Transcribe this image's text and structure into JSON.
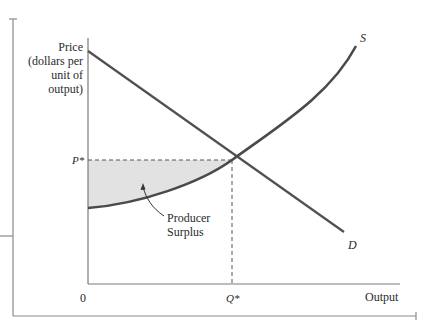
{
  "diagram": {
    "type": "producer-surplus-supply-demand",
    "axes": {
      "y_label_lines": [
        "Price",
        "(dollars per",
        "unit of",
        "output)"
      ],
      "x_label": "Output",
      "origin_label": "0"
    },
    "equilibrium": {
      "price_label": "P*",
      "quantity_label": "Q*"
    },
    "curves": {
      "supply_label": "S",
      "demand_label": "D"
    },
    "annotation": {
      "lines": [
        "Producer",
        "Surplus"
      ]
    },
    "colors": {
      "curve": "#4a4a4a",
      "axis": "#777777",
      "surplus_fill": "#e2e2e2",
      "text": "#2a2a2a"
    }
  }
}
